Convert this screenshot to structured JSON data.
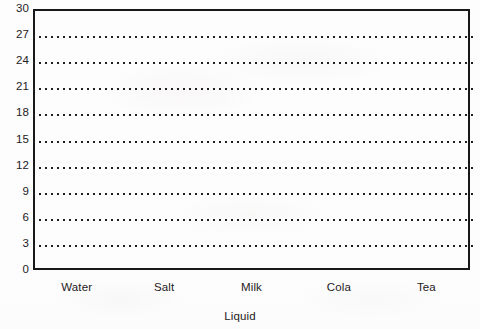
{
  "chart_data": {
    "type": "bar",
    "title": "",
    "subtitle": "",
    "xlabel": "Liquid",
    "ylabel": "",
    "categories": [
      "Water",
      "Salt",
      "Milk",
      "Cola",
      "Tea"
    ],
    "values": [
      null,
      null,
      null,
      null,
      null
    ],
    "series": [],
    "ylim": [
      0,
      30
    ],
    "ytick_step": 3,
    "yticks": [
      30,
      27,
      24,
      21,
      18,
      15,
      12,
      9,
      6,
      3,
      0
    ],
    "ytick_labels": [
      "30",
      "27",
      "24",
      "21",
      "18",
      "15",
      "12",
      "9",
      "6",
      "3",
      "0"
    ],
    "grid": true,
    "grid_style": "dotted-horizontal",
    "legend": false,
    "legend_position": "none",
    "annotations": [],
    "note": "Blank axes template: plot area contains no plotted bars or data marks."
  },
  "axes": {
    "y_labels": [
      "30",
      "27",
      "24",
      "21",
      "18",
      "15",
      "12",
      "9",
      "6",
      "3",
      "0"
    ],
    "x_labels": [
      "Water",
      "Salt",
      "Milk",
      "Cola",
      "Tea"
    ],
    "x_title": "Liquid"
  },
  "colors": {
    "axis": "#17181a",
    "gridline": "#1d1e20",
    "text": "#1f2022",
    "background": "#fdfdfd"
  }
}
